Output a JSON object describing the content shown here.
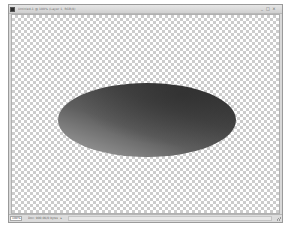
{
  "window": {
    "title": "Untitled-1 @ 100% (Layer 1, RGB/8)",
    "controls": {
      "minimize": "_",
      "maximize": "□",
      "close": "×"
    }
  },
  "canvas": {
    "background": "transparency-checkerboard",
    "shape": {
      "type": "ellipse",
      "fill": "linear-gradient",
      "gradient_colors": [
        "#333333",
        "#474747",
        "#5e5e5e",
        "#8c8c8c",
        "#a4a4a4"
      ]
    }
  },
  "status_bar": {
    "zoom": "100%",
    "doc_info": "Doc: 900.0K/0 bytes",
    "arrow": "▸"
  }
}
